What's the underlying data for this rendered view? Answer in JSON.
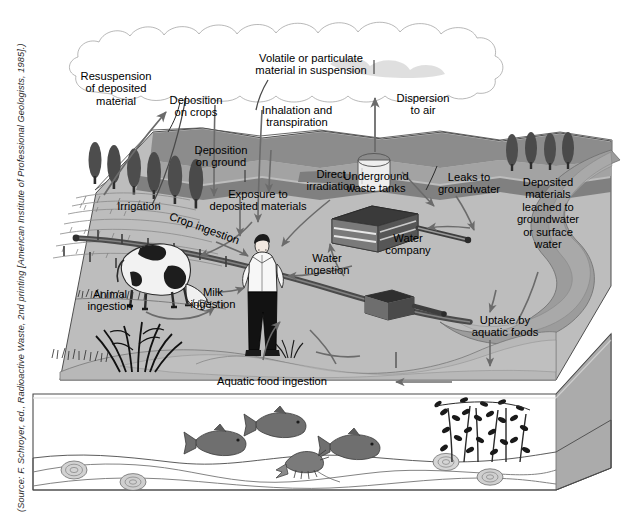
{
  "figure": {
    "kind": "3d-block-diagram",
    "style": "grayscale textbook illustration",
    "credit": "(Source: F. Schroyer, ed., Radioactive Waste, 2nd printing [American Institute of Professional Geologists, 1985].)"
  },
  "labels": {
    "resuspension": "Resuspension\nof deposited\nmaterial",
    "deposition_crops": "Deposition\non crops",
    "volatile": "Volatile or particulate\nmaterial in suspension",
    "inhalation": "Inhalation and\ntranspiration",
    "dispersion": "Dispersion\nto air",
    "deposition_ground": "Deposition\non ground",
    "underground_tanks": "Underground\nwaste tanks",
    "leaks_groundwater": "Leaks to\ngroundwater",
    "deposited_leached": "Deposited\nmaterials\nleached to\ngroundwater\nor surface\nwater",
    "exposure_deposited": "Exposure to\ndeposited materials",
    "direct_irradiation": "Direct\nirradiation",
    "irrigation": "Irrigation",
    "crop_ingestion": "Crop ingestion",
    "water_company": "Water\ncompany",
    "water_ingestion": "Water\ningestion",
    "animal_ingestion": "Animal\ningestion",
    "milk_ingestion": "Milk\ningestion",
    "uptake_aquatic": "Uptake by\naquatic foods",
    "aquatic_food_ingestion": "Aquatic food ingestion"
  },
  "colors": {
    "background": "#ffffff",
    "cloud_light": "#d9d9d9",
    "cloud_mid": "#bdbdbd",
    "cloud_dark": "#a6a6a6",
    "land_top": "#b4b4b4",
    "land_light": "#c8c8c8",
    "land_mid": "#9e9e9e",
    "land_dark": "#7a7a7a",
    "water_band": "#8f8f8f",
    "water_body_light": "#bfbfbf",
    "water_body_mid": "#a0a0a0",
    "sediment": "#909090",
    "block_side": "#b0b0b0",
    "outline": "#4a4a4a",
    "arrow": "#6b6b6b",
    "pipe": "#5a5a5a",
    "tank_dark": "#3c3c3c",
    "tree_dark": "#4f4f4f",
    "ink": "#000000"
  },
  "scene_objects": [
    {
      "name": "cumulus-cloud-bank",
      "interactable": false
    },
    {
      "name": "poplar-tree-row-left",
      "count": 6
    },
    {
      "name": "poplar-tree-row-right",
      "count": 4
    },
    {
      "name": "crop-field-furrows",
      "interactable": false
    },
    {
      "name": "irrigation-fence-posts",
      "count": 6
    },
    {
      "name": "grazing-cow",
      "interactable": false
    },
    {
      "name": "standing-person",
      "interactable": false
    },
    {
      "name": "marsh-reeds",
      "interactable": false
    },
    {
      "name": "storage-tank-cylinder",
      "interactable": false
    },
    {
      "name": "water-treatment-building",
      "interactable": false
    },
    {
      "name": "pump-house-box",
      "interactable": false
    },
    {
      "name": "buried-pipeline",
      "interactable": false
    },
    {
      "name": "river-channel",
      "interactable": false
    },
    {
      "name": "fish",
      "count": 3
    },
    {
      "name": "crayfish",
      "count": 1
    },
    {
      "name": "shellfish",
      "count": 4
    },
    {
      "name": "aquatic-plants",
      "count": 1
    }
  ]
}
